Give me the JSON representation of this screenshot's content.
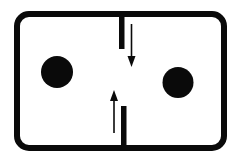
{
  "diagram": {
    "colors": {
      "stroke": "#0a0a0a",
      "fill": "#0a0a0a",
      "background": "#ffffff"
    },
    "elements": [
      {
        "id": "chamber",
        "type": "rounded-rectangle-outline"
      },
      {
        "id": "top-barrier",
        "type": "partition-segment",
        "from": "top-wall"
      },
      {
        "id": "bottom-barrier",
        "type": "partition-segment",
        "from": "bottom-wall"
      },
      {
        "id": "down-arrow",
        "type": "arrow",
        "direction": "down"
      },
      {
        "id": "up-arrow",
        "type": "arrow",
        "direction": "up"
      },
      {
        "id": "left-particle",
        "type": "filled-circle",
        "side": "left"
      },
      {
        "id": "right-particle",
        "type": "filled-circle",
        "side": "right"
      }
    ]
  }
}
